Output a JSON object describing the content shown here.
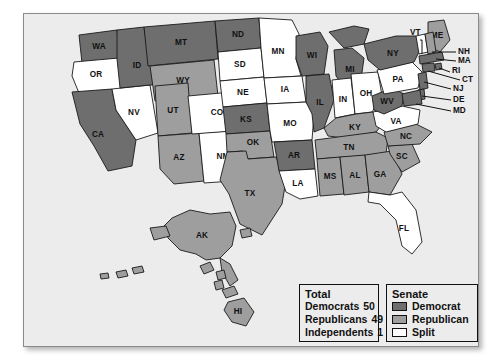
{
  "map": {
    "title": "United States Senate party control by state",
    "background_color": "#ececec",
    "colors": {
      "democrat": "#6e6e6e",
      "republican": "#9e9e9e",
      "split": "#ffffff",
      "outline": "#1a1a1a"
    },
    "states": [
      {
        "code": "WA",
        "status": "democrat"
      },
      {
        "code": "OR",
        "status": "split"
      },
      {
        "code": "CA",
        "status": "democrat"
      },
      {
        "code": "NV",
        "status": "split"
      },
      {
        "code": "ID",
        "status": "democrat"
      },
      {
        "code": "MT",
        "status": "democrat"
      },
      {
        "code": "WY",
        "status": "republican"
      },
      {
        "code": "UT",
        "status": "republican"
      },
      {
        "code": "AZ",
        "status": "republican"
      },
      {
        "code": "NM",
        "status": "split"
      },
      {
        "code": "CO",
        "status": "split"
      },
      {
        "code": "ND",
        "status": "democrat"
      },
      {
        "code": "SD",
        "status": "split"
      },
      {
        "code": "NE",
        "status": "split"
      },
      {
        "code": "KS",
        "status": "democrat"
      },
      {
        "code": "OK",
        "status": "republican"
      },
      {
        "code": "TX",
        "status": "republican"
      },
      {
        "code": "MN",
        "status": "split"
      },
      {
        "code": "IA",
        "status": "split"
      },
      {
        "code": "MO",
        "status": "split"
      },
      {
        "code": "AR",
        "status": "democrat"
      },
      {
        "code": "LA",
        "status": "split"
      },
      {
        "code": "WI",
        "status": "democrat"
      },
      {
        "code": "IL",
        "status": "democrat"
      },
      {
        "code": "MI",
        "status": "democrat"
      },
      {
        "code": "IN",
        "status": "split"
      },
      {
        "code": "OH",
        "status": "split"
      },
      {
        "code": "KY",
        "status": "republican"
      },
      {
        "code": "TN",
        "status": "republican"
      },
      {
        "code": "MS",
        "status": "republican"
      },
      {
        "code": "AL",
        "status": "republican"
      },
      {
        "code": "GA",
        "status": "republican"
      },
      {
        "code": "FL",
        "status": "split"
      },
      {
        "code": "SC",
        "status": "republican"
      },
      {
        "code": "NC",
        "status": "republican"
      },
      {
        "code": "VA",
        "status": "split"
      },
      {
        "code": "WV",
        "status": "democrat"
      },
      {
        "code": "PA",
        "status": "split"
      },
      {
        "code": "NY",
        "status": "democrat"
      },
      {
        "code": "ME",
        "status": "republican"
      },
      {
        "code": "VT",
        "status": "split"
      },
      {
        "code": "NH",
        "status": "republican"
      },
      {
        "code": "MA",
        "status": "democrat"
      },
      {
        "code": "RI",
        "status": "democrat"
      },
      {
        "code": "CT",
        "status": "democrat"
      },
      {
        "code": "NJ",
        "status": "democrat"
      },
      {
        "code": "DE",
        "status": "democrat"
      },
      {
        "code": "MD",
        "status": "democrat"
      },
      {
        "code": "AK",
        "status": "republican"
      },
      {
        "code": "HI",
        "status": "republican"
      }
    ],
    "callout_labels": [
      "VT",
      "NH",
      "MA",
      "RI",
      "CT",
      "NJ",
      "DE",
      "MD"
    ]
  },
  "legend": {
    "total": {
      "title": "Total",
      "rows": [
        {
          "label": "Democrats",
          "value": "50"
        },
        {
          "label": "Republicans",
          "value": "49"
        },
        {
          "label": "Independents",
          "value": "1"
        }
      ]
    },
    "senate": {
      "title": "Senate",
      "rows": [
        {
          "label": "Democrat",
          "swatch": "democrat"
        },
        {
          "label": "Republican",
          "swatch": "republican"
        },
        {
          "label": "Split",
          "swatch": "split"
        }
      ]
    }
  }
}
